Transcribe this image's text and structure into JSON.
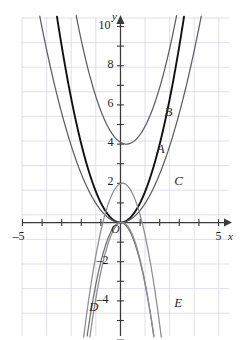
{
  "chart_data": {
    "type": "line",
    "title": "",
    "xlabel": "x",
    "ylabel": "y",
    "xlim": [
      -5.6,
      5.6
    ],
    "ylim": [
      -6.2,
      10.9
    ],
    "grid": true,
    "grid_color": "#d9d5ea",
    "axis_color": "#3a3a3a",
    "origin_label": "O",
    "x_ticks": [
      -5,
      5
    ],
    "x_tick_labels": [
      "–5",
      "5"
    ],
    "y_ticks": [
      2,
      4,
      6,
      8,
      10
    ],
    "y_tick_labels": [
      "2",
      "4",
      "6",
      "8",
      "10"
    ],
    "y_neg_ticks": [
      -2,
      -4
    ],
    "y_neg_tick_labels": [
      "–2",
      "–4"
    ],
    "legend_position": "inline-annotations",
    "series": [
      {
        "name": "A",
        "label": "A",
        "equation": "y = x^2",
        "a": 1.0,
        "h": 0.0,
        "k": 0.0,
        "color": "#111111",
        "width": 1.9,
        "label_x": 2.05,
        "label_y": 3.7
      },
      {
        "name": "B",
        "label": "B",
        "equation": "y = x^2 - 0.6x + 4.1",
        "a": 1.0,
        "h": 0.3,
        "k": 4.0,
        "color": "#5d5d66",
        "width": 1.25,
        "label_x": 2.45,
        "label_y": 5.6
      },
      {
        "name": "C",
        "label": "C",
        "equation": "y = 0.62x^2",
        "a": 0.62,
        "h": 0.0,
        "k": 0.0,
        "color": "#5d5d66",
        "width": 1.25,
        "label_x": 2.95,
        "label_y": 2.05
      },
      {
        "name": "D",
        "label": "D",
        "equation": "y = -2x^2",
        "a": -2.0,
        "h": 0.0,
        "k": 0.0,
        "color": "#6f6f77",
        "width": 1.25,
        "label_x": -1.4,
        "label_y": -4.35
      },
      {
        "name": "E",
        "label": "E",
        "equation": "y = -2.2x^2 + 0.3x",
        "a": -2.2,
        "h": 0.07,
        "k": 0.01,
        "color": "#8c8c94",
        "width": 1.25,
        "label_x": 2.95,
        "label_y": -4.15
      },
      {
        "name": "D2",
        "label": "",
        "equation": "y = -2(x-0.12)^2 + 2",
        "a": -2.0,
        "h": 0.1,
        "k": 2.0,
        "color": "#8c8c94",
        "width": 1.25,
        "label_x": null,
        "label_y": null
      }
    ],
    "annotations": [
      "A",
      "B",
      "C",
      "D",
      "E",
      "O"
    ]
  },
  "axes": {
    "x_axis_name": "x",
    "y_axis_name": "y",
    "origin": "O"
  }
}
